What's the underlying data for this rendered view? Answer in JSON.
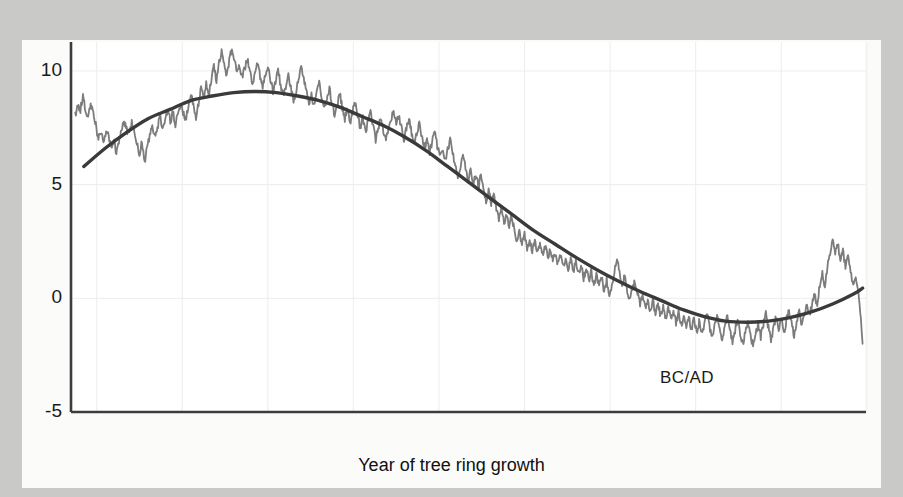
{
  "figure": {
    "background_color": "#c9c9c7",
    "panel_color": "#fbfbfa",
    "plot_background": "#ffffff"
  },
  "axis": {
    "y_ticks": [
      "10",
      "5",
      "0",
      "-5"
    ],
    "x_ticks": [
      "7000",
      "6000",
      "5000",
      "4000",
      "3000",
      "2000",
      "1000",
      "0",
      "1000",
      "2000"
    ],
    "xlabel": "Year of tree ring growth",
    "ylabel_prefix": "Change in ",
    "ylabel_sup": "14",
    "ylabel_suffix": "C (%) from 19th-century value"
  },
  "annotations": {
    "bc_ad": "BC/AD"
  },
  "chart_data": {
    "type": "line",
    "title": "",
    "xlabel": "Year of tree ring growth",
    "ylabel": "Change in 14C (%) from 19th-century value",
    "xlim": [
      -7300,
      1990
    ],
    "ylim": [
      -5,
      12
    ],
    "x_tick_values": [
      -7000,
      -6000,
      -5000,
      -4000,
      -3000,
      -2000,
      -1000,
      0,
      1000,
      2000
    ],
    "x_tick_labels": [
      "7000",
      "6000",
      "5000",
      "4000",
      "3000",
      "2000",
      "1000",
      "0",
      "1000",
      "2000"
    ],
    "y_tick_values": [
      10,
      5,
      0,
      -5
    ],
    "grid": true,
    "legend": "none",
    "annotations": [
      {
        "text": "BC/AD",
        "x": -120,
        "y": -3.2
      }
    ],
    "axis_note": "Negative x values are BC years, positive x values are AD years; the BC/AD boundary is at x = 0.",
    "series": [
      {
        "name": "Measured 14C deviation (decadal tree ring data)",
        "color": "#7c7c7c",
        "linewidth": 1.8,
        "style": "noisy",
        "x": [
          -7250,
          -7220,
          -7190,
          -7160,
          -7130,
          -7100,
          -7070,
          -7040,
          -7010,
          -6980,
          -6950,
          -6920,
          -6890,
          -6860,
          -6830,
          -6800,
          -6770,
          -6740,
          -6710,
          -6680,
          -6650,
          -6620,
          -6590,
          -6560,
          -6530,
          -6500,
          -6470,
          -6440,
          -6410,
          -6380,
          -6350,
          -6320,
          -6290,
          -6260,
          -6230,
          -6200,
          -6170,
          -6140,
          -6110,
          -6080,
          -6050,
          -6020,
          -5990,
          -5960,
          -5930,
          -5900,
          -5870,
          -5840,
          -5810,
          -5780,
          -5750,
          -5720,
          -5690,
          -5660,
          -5630,
          -5600,
          -5570,
          -5540,
          -5510,
          -5480,
          -5450,
          -5420,
          -5390,
          -5360,
          -5330,
          -5300,
          -5270,
          -5240,
          -5210,
          -5180,
          -5150,
          -5120,
          -5090,
          -5060,
          -5030,
          -5000,
          -4970,
          -4940,
          -4910,
          -4880,
          -4850,
          -4820,
          -4790,
          -4760,
          -4730,
          -4700,
          -4670,
          -4640,
          -4610,
          -4580,
          -4550,
          -4520,
          -4490,
          -4460,
          -4430,
          -4400,
          -4370,
          -4340,
          -4310,
          -4280,
          -4250,
          -4220,
          -4190,
          -4160,
          -4130,
          -4100,
          -4070,
          -4040,
          -4010,
          -3980,
          -3950,
          -3920,
          -3890,
          -3860,
          -3830,
          -3800,
          -3770,
          -3740,
          -3710,
          -3680,
          -3650,
          -3620,
          -3590,
          -3560,
          -3530,
          -3500,
          -3470,
          -3440,
          -3410,
          -3380,
          -3350,
          -3320,
          -3290,
          -3260,
          -3230,
          -3200,
          -3170,
          -3140,
          -3110,
          -3080,
          -3050,
          -3020,
          -2990,
          -2960,
          -2930,
          -2900,
          -2870,
          -2840,
          -2810,
          -2780,
          -2750,
          -2720,
          -2690,
          -2660,
          -2630,
          -2600,
          -2570,
          -2540,
          -2510,
          -2480,
          -2450,
          -2420,
          -2390,
          -2360,
          -2330,
          -2300,
          -2270,
          -2240,
          -2210,
          -2180,
          -2150,
          -2120,
          -2090,
          -2060,
          -2030,
          -2000,
          -1970,
          -1940,
          -1910,
          -1880,
          -1850,
          -1820,
          -1790,
          -1760,
          -1730,
          -1700,
          -1670,
          -1640,
          -1610,
          -1580,
          -1550,
          -1520,
          -1490,
          -1460,
          -1430,
          -1400,
          -1370,
          -1340,
          -1310,
          -1280,
          -1250,
          -1220,
          -1190,
          -1160,
          -1130,
          -1100,
          -1070,
          -1040,
          -1010,
          -980,
          -950,
          -920,
          -890,
          -860,
          -830,
          -800,
          -770,
          -740,
          -710,
          -680,
          -650,
          -620,
          -590,
          -560,
          -530,
          -500,
          -470,
          -440,
          -410,
          -380,
          -350,
          -320,
          -290,
          -260,
          -230,
          -200,
          -170,
          -140,
          -110,
          -80,
          -50,
          -20,
          10,
          40,
          70,
          100,
          130,
          160,
          190,
          220,
          250,
          280,
          310,
          340,
          370,
          400,
          430,
          460,
          490,
          520,
          550,
          580,
          610,
          640,
          670,
          700,
          730,
          760,
          790,
          820,
          850,
          880,
          910,
          940,
          970,
          1000,
          1030,
          1060,
          1090,
          1120,
          1150,
          1180,
          1210,
          1240,
          1270,
          1300,
          1330,
          1360,
          1390,
          1420,
          1450,
          1480,
          1510,
          1540,
          1570,
          1600,
          1630,
          1660,
          1690,
          1720,
          1750,
          1780,
          1810,
          1840,
          1870,
          1900,
          1930,
          1950
        ],
        "y": [
          8.0,
          8.5,
          8.3,
          8.9,
          8.2,
          7.9,
          8.6,
          8.1,
          7.6,
          7.0,
          7.3,
          6.9,
          7.4,
          7.1,
          6.6,
          7.0,
          6.3,
          6.9,
          7.5,
          7.8,
          7.4,
          7.2,
          7.7,
          7.3,
          6.8,
          6.3,
          6.9,
          6.0,
          6.6,
          7.2,
          7.6,
          7.1,
          7.5,
          8.0,
          7.4,
          7.9,
          8.3,
          7.8,
          8.2,
          7.6,
          8.1,
          8.6,
          8.2,
          7.9,
          8.4,
          9.0,
          8.5,
          8.0,
          8.6,
          9.2,
          8.8,
          9.4,
          9.0,
          9.6,
          10.2,
          9.6,
          10.4,
          10.9,
          10.3,
          9.8,
          10.5,
          11.0,
          10.4,
          9.9,
          10.3,
          9.7,
          10.1,
          10.6,
          10.0,
          9.5,
          9.9,
          10.4,
          9.8,
          9.3,
          9.8,
          10.2,
          9.6,
          9.1,
          9.5,
          10.0,
          9.4,
          8.9,
          9.3,
          9.8,
          9.2,
          8.7,
          9.1,
          9.6,
          10.3,
          9.7,
          9.2,
          8.6,
          9.0,
          8.4,
          9.0,
          9.5,
          8.9,
          8.3,
          8.8,
          9.2,
          8.6,
          8.1,
          8.5,
          9.0,
          8.4,
          7.9,
          8.3,
          7.7,
          8.2,
          8.6,
          8.0,
          7.5,
          7.9,
          7.3,
          7.8,
          8.2,
          7.6,
          7.0,
          7.5,
          8.0,
          7.4,
          6.9,
          7.4,
          7.9,
          8.3,
          7.7,
          8.1,
          7.5,
          7.0,
          7.5,
          7.9,
          7.3,
          6.8,
          7.2,
          7.7,
          7.1,
          6.6,
          7.0,
          6.4,
          6.9,
          7.3,
          6.7,
          6.2,
          6.6,
          6.0,
          6.5,
          7.0,
          6.4,
          5.9,
          5.4,
          5.8,
          6.3,
          5.7,
          5.2,
          5.6,
          5.0,
          5.5,
          4.9,
          5.4,
          4.8,
          4.3,
          4.7,
          4.2,
          4.6,
          4.0,
          3.5,
          3.9,
          3.3,
          3.8,
          3.2,
          3.6,
          3.0,
          2.5,
          2.9,
          2.4,
          2.8,
          2.2,
          2.6,
          2.1,
          2.5,
          2.0,
          2.4,
          1.9,
          2.3,
          1.8,
          2.2,
          1.6,
          2.0,
          1.5,
          1.9,
          1.4,
          1.8,
          1.3,
          1.7,
          1.2,
          1.6,
          1.1,
          1.5,
          0.9,
          1.3,
          0.8,
          1.2,
          0.6,
          1.0,
          0.5,
          0.9,
          0.3,
          0.8,
          0.2,
          0.6,
          1.2,
          1.7,
          1.1,
          0.5,
          1.0,
          0.4,
          -0.1,
          0.4,
          0.8,
          0.2,
          -0.3,
          0.1,
          -0.4,
          0.0,
          -0.6,
          -0.1,
          -0.7,
          -0.2,
          -0.8,
          -0.3,
          -0.9,
          -0.4,
          -1.0,
          -0.5,
          -1.1,
          -0.6,
          -1.2,
          -0.7,
          -1.3,
          -0.8,
          -1.4,
          -0.9,
          -1.5,
          -1.0,
          -1.6,
          -1.1,
          -0.6,
          -1.2,
          -1.7,
          -1.2,
          -0.7,
          -1.3,
          -1.8,
          -1.3,
          -0.8,
          -1.4,
          -1.9,
          -1.4,
          -0.9,
          -1.5,
          -2.0,
          -1.5,
          -1.0,
          -1.6,
          -2.1,
          -1.6,
          -1.1,
          -1.7,
          -1.2,
          -0.7,
          -1.3,
          -1.8,
          -1.3,
          -0.8,
          -1.4,
          -0.9,
          -1.5,
          -1.0,
          -0.5,
          -1.1,
          -1.6,
          -1.1,
          -0.6,
          -1.2,
          -0.7,
          -0.2,
          -0.8,
          -0.3,
          0.2,
          -0.4,
          0.6,
          1.1,
          0.5,
          1.4,
          2.0,
          2.6,
          1.9,
          2.4,
          1.7,
          2.1,
          1.4,
          1.8,
          1.1,
          0.6,
          0.9,
          0.3,
          -0.9,
          -2.0
        ]
      },
      {
        "name": "Smoothed long-term trend",
        "color": "#3a3a3a",
        "linewidth": 3.4,
        "style": "smooth",
        "x": [
          -7150,
          -6900,
          -6650,
          -6400,
          -6150,
          -5900,
          -5650,
          -5400,
          -5150,
          -4900,
          -4650,
          -4400,
          -4150,
          -3900,
          -3650,
          -3400,
          -3150,
          -2900,
          -2650,
          -2400,
          -2150,
          -1900,
          -1650,
          -1400,
          -1150,
          -900,
          -650,
          -400,
          -150,
          100,
          350,
          600,
          850,
          1100,
          1350,
          1600,
          1850,
          1950
        ],
        "y": [
          5.8,
          6.6,
          7.3,
          7.9,
          8.3,
          8.7,
          8.9,
          9.05,
          9.1,
          9.05,
          8.9,
          8.7,
          8.4,
          8.0,
          7.6,
          7.1,
          6.5,
          5.8,
          5.1,
          4.4,
          3.7,
          3.0,
          2.4,
          1.8,
          1.25,
          0.75,
          0.3,
          -0.1,
          -0.5,
          -0.8,
          -1.0,
          -1.05,
          -1.0,
          -0.85,
          -0.6,
          -0.25,
          0.2,
          0.45
        ]
      }
    ]
  }
}
